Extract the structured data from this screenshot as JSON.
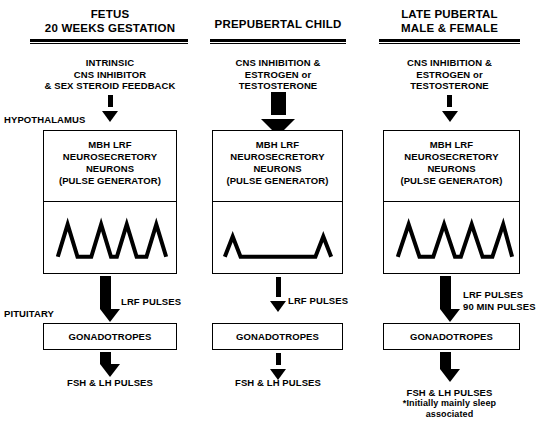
{
  "diagram": {
    "side_labels": {
      "hypothalamus": "HYPOTHALAMUS",
      "pituitary": "PITUITARY"
    },
    "columns": [
      {
        "id": "fetus",
        "header_line1": "FETUS",
        "header_line2": "20 WEEKS GESTATION",
        "stimulus_line1": "INTRINSIC",
        "stimulus_line2": "CNS INHIBITOR",
        "stimulus_line3": "& SEX STEROID FEEDBACK",
        "stimulus_arrow_style": "dotted-thin",
        "hypothalamus_box_line1": "MBH LRF",
        "hypothalamus_box_line2": "NEUROSECRETORY",
        "hypothalamus_box_line3": "NEURONS",
        "hypothalamus_box_line4": "(PULSE GENERATOR)",
        "pulse_arrow_style": "solid-thick",
        "lrf_caption_line1": "LRF PULSES",
        "lrf_caption_line2": "",
        "gonadotropes_label": "GONADOTROPES",
        "output_arrow_style": "solid-thick",
        "output_caption": "FSH & LH PULSES",
        "output_note_line1": "",
        "output_note_line2": ""
      },
      {
        "id": "prepubertal",
        "header_line1": "PREPUBERTAL CHILD",
        "header_line2": "",
        "stimulus_line1": "CNS INHIBITION &",
        "stimulus_line2": "ESTROGEN or",
        "stimulus_line3": "TESTOSTERONE",
        "stimulus_arrow_style": "dashed-thick",
        "hypothalamus_box_line1": "MBH LRF",
        "hypothalamus_box_line2": "NEUROSECRETORY",
        "hypothalamus_box_line3": "NEURONS",
        "hypothalamus_box_line4": "(PULSE GENERATOR)",
        "pulse_arrow_style": "dotted-thin",
        "lrf_caption_line1": "LRF PULSES",
        "lrf_caption_line2": "",
        "gonadotropes_label": "GONADOTROPES",
        "output_arrow_style": "dotted-thin",
        "output_caption": "FSH & LH PULSES",
        "output_note_line1": "",
        "output_note_line2": ""
      },
      {
        "id": "late-pubertal",
        "header_line1": "LATE PUBERTAL",
        "header_line2": "MALE & FEMALE",
        "stimulus_line1": "CNS INHIBITION &",
        "stimulus_line2": "ESTROGEN or",
        "stimulus_line3": "TESTOSTERONE",
        "stimulus_arrow_style": "dotted-thin",
        "hypothalamus_box_line1": "MBH LRF",
        "hypothalamus_box_line2": "NEUROSECRETORY",
        "hypothalamus_box_line3": "NEURONS",
        "hypothalamus_box_line4": "(PULSE GENERATOR)",
        "pulse_arrow_style": "solid-thick",
        "lrf_caption_line1": "LRF PULSES",
        "lrf_caption_line2": "90 MIN PULSES",
        "gonadotropes_label": "GONADOTROPES",
        "output_arrow_style": "solid-thick",
        "output_caption": "FSH & LH PULSES",
        "output_note_line1": "*Initially mainly sleep",
        "output_note_line2": "associated"
      }
    ],
    "waveforms": [
      {
        "id": "fetus-waveform",
        "pulse_count": 4,
        "amplitude": "high",
        "description": "four regular triangular pulses"
      },
      {
        "id": "prepubertal-waveform",
        "pulse_count": 2,
        "amplitude": "low",
        "description": "two small pulses separated by a long flat baseline"
      },
      {
        "id": "late-pubertal-waveform",
        "pulse_count": 4,
        "amplitude": "high",
        "description": "four regular triangular pulses"
      }
    ],
    "colors": {
      "ink": "#000000",
      "background": "#ffffff"
    }
  }
}
